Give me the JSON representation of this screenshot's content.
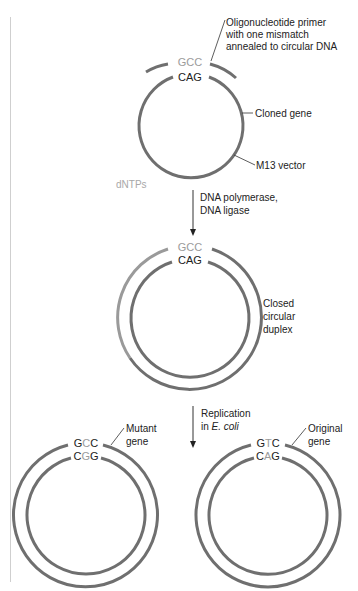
{
  "colors": {
    "strand": "#6f6f6f",
    "strand_light": "#9a9a9a",
    "text": "#222222",
    "gray_base": "#9b9b9b",
    "margin_line": "#c8c8c8"
  },
  "step1": {
    "primer_label": [
      "Oligonucleotide primer",
      "with one mismatch",
      "annealed to circular DNA"
    ],
    "primer_seq": [
      {
        "b": "G",
        "hl": true
      },
      {
        "b": "C",
        "hl": true
      },
      {
        "b": "C",
        "hl": true
      }
    ],
    "template_seq": [
      {
        "b": "C",
        "hl": false
      },
      {
        "b": "A",
        "hl": false
      },
      {
        "b": "G",
        "hl": false
      }
    ],
    "cloned_gene_label": "Cloned gene",
    "vector_label": "M13 vector",
    "dntps_label": "dNTPs"
  },
  "arrow1": {
    "label": [
      "DNA polymerase,",
      "DNA ligase"
    ]
  },
  "step2": {
    "outer_seq": [
      {
        "b": "G",
        "hl": true
      },
      {
        "b": "C",
        "hl": true
      },
      {
        "b": "C",
        "hl": true
      }
    ],
    "inner_seq": [
      {
        "b": "C",
        "hl": false
      },
      {
        "b": "A",
        "hl": false
      },
      {
        "b": "G",
        "hl": false
      }
    ],
    "label": [
      "Closed",
      "circular",
      "duplex"
    ]
  },
  "arrow2": {
    "label_line1": "Replication",
    "label_line2_prefix": "in ",
    "label_line2_italic": "E. coli"
  },
  "mutant": {
    "outer_seq": [
      {
        "b": "G",
        "hl": false
      },
      {
        "b": "C",
        "hl": true
      },
      {
        "b": "C",
        "hl": false
      }
    ],
    "inner_seq": [
      {
        "b": "C",
        "hl": false
      },
      {
        "b": "G",
        "hl": true
      },
      {
        "b": "G",
        "hl": false
      }
    ],
    "label": [
      "Mutant",
      "gene"
    ]
  },
  "original": {
    "outer_seq": [
      {
        "b": "G",
        "hl": false
      },
      {
        "b": "T",
        "hl": true
      },
      {
        "b": "C",
        "hl": false
      }
    ],
    "inner_seq": [
      {
        "b": "C",
        "hl": false
      },
      {
        "b": "A",
        "hl": true
      },
      {
        "b": "G",
        "hl": false
      }
    ],
    "label": [
      "Original",
      "gene"
    ]
  }
}
